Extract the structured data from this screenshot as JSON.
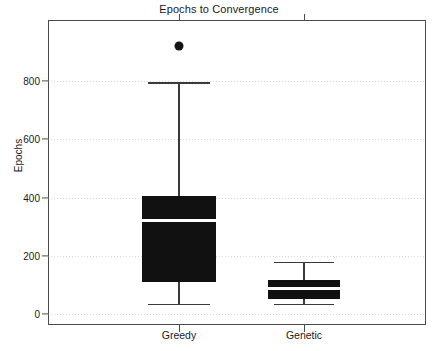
{
  "chart_data": {
    "type": "box",
    "title": "Epochs to Convergence",
    "xlabel": "",
    "ylabel": "Epochs",
    "ylim": [
      -40,
      1045
    ],
    "yticks": [
      0,
      200,
      400,
      600,
      800
    ],
    "ytick_labels": [
      "0",
      "200",
      "400",
      "600",
      "800"
    ],
    "grid": true,
    "legend": null,
    "categories": [
      "Greedy",
      "Genetic"
    ],
    "boxes": [
      {
        "name": "Greedy",
        "whisker_low": 35,
        "q1": 110,
        "median": 322,
        "q3": 405,
        "whisker_high": 795,
        "outliers": [
          920
        ],
        "fill": "#111111",
        "median_color": "#ffffff"
      },
      {
        "name": "Genetic",
        "whisker_low": 34,
        "q1": 51,
        "median": 88,
        "q3": 116,
        "whisker_high": 178,
        "outliers": [],
        "fill": "#111111",
        "median_color": "#ffffff"
      }
    ]
  },
  "style": {
    "frame_color": "#4a4a4a",
    "grid_color": "#b9b9b9",
    "text_color": "#1a1a1a",
    "background": "#ffffff"
  }
}
